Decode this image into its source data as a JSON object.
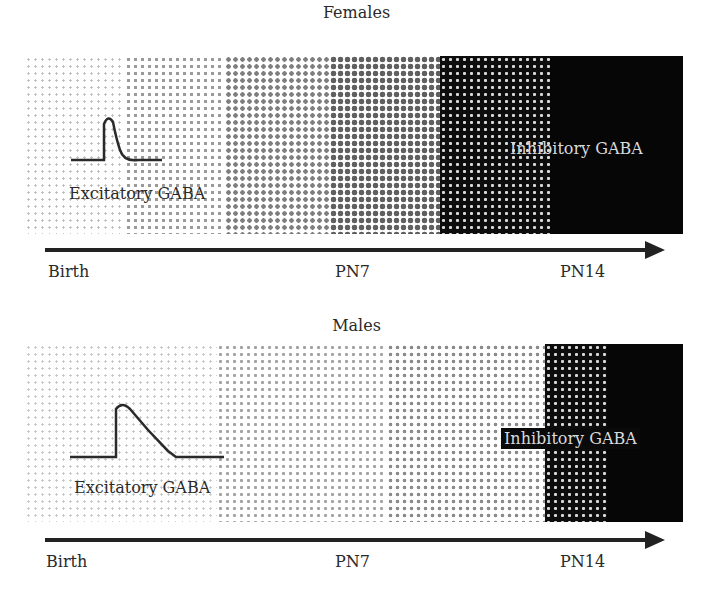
{
  "figure": {
    "panels": [
      {
        "title": "Females",
        "excitatory_label": "Excitatory GABA",
        "inhibitory_label": "Inhibitory GABA",
        "axis": {
          "ticks": [
            "Birth",
            "PN7",
            "PN14"
          ]
        },
        "shading_segments": [
          "very light dots",
          "light dots",
          "medium dots",
          "dark dots",
          "inverted dense",
          "solid black"
        ]
      },
      {
        "title": "Males",
        "excitatory_label": "Excitatory GABA",
        "inhibitory_label": "Inhibitory GABA",
        "axis": {
          "ticks": [
            "Birth",
            "PN7",
            "PN14"
          ]
        },
        "shading_segments": [
          "very light dots",
          "light dots",
          "medium dots",
          "inverted dense",
          "solid black"
        ]
      }
    ],
    "colors": {
      "axis": "#222222",
      "solid": "#060606",
      "text": "#2a2a2a",
      "inverse_text": "#d9d9d9"
    }
  }
}
